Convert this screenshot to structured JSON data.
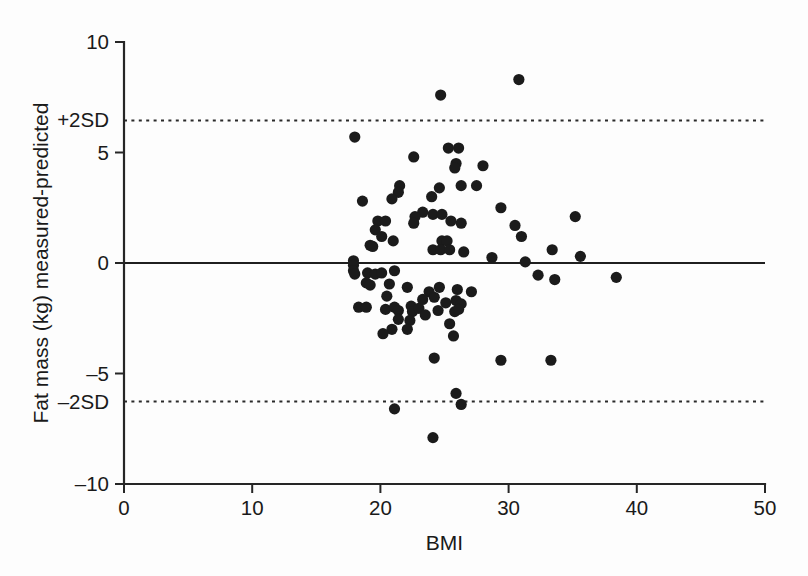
{
  "chart_data": {
    "type": "scatter",
    "title": "",
    "xlabel": "BMI",
    "ylabel": "Fat mass (kg) measured-predicted",
    "xlim": [
      0,
      50
    ],
    "ylim": [
      -10,
      10
    ],
    "xticks": [
      "0",
      "10",
      "20",
      "30",
      "40",
      "50"
    ],
    "xtick_values": [
      0,
      10,
      20,
      30,
      40,
      50
    ],
    "yticks": [
      "10",
      "5",
      "0",
      "-5",
      "-10"
    ],
    "ytick_values": [
      10,
      5,
      0,
      -5,
      -10
    ],
    "grid": false,
    "legend": "none",
    "reference_lines": [
      {
        "label": "+2SD",
        "value": 6.45,
        "style": "dotted"
      },
      {
        "label": "",
        "value": 0,
        "style": "solid"
      },
      {
        "label": "-2SD",
        "value": -6.27,
        "style": "dotted"
      }
    ],
    "marker": {
      "shape": "circle",
      "radius_px": 5.6,
      "color": "#1b1b1b"
    },
    "points": [
      [
        30.8,
        8.3
      ],
      [
        24.7,
        7.6
      ],
      [
        18.0,
        5.7
      ],
      [
        25.3,
        5.2
      ],
      [
        26.1,
        5.2
      ],
      [
        22.6,
        4.8
      ],
      [
        25.9,
        4.5
      ],
      [
        25.8,
        4.3
      ],
      [
        28.0,
        4.4
      ],
      [
        27.5,
        3.5
      ],
      [
        26.3,
        3.5
      ],
      [
        21.5,
        3.5
      ],
      [
        21.4,
        3.2
      ],
      [
        24.6,
        3.4
      ],
      [
        20.9,
        2.9
      ],
      [
        24.0,
        3.0
      ],
      [
        18.6,
        2.8
      ],
      [
        29.4,
        2.5
      ],
      [
        24.1,
        2.2
      ],
      [
        23.3,
        2.3
      ],
      [
        24.8,
        2.2
      ],
      [
        22.7,
        2.1
      ],
      [
        22.6,
        1.8
      ],
      [
        19.8,
        1.9
      ],
      [
        20.4,
        1.9
      ],
      [
        19.6,
        1.5
      ],
      [
        25.5,
        1.9
      ],
      [
        26.3,
        1.8
      ],
      [
        30.5,
        1.7
      ],
      [
        35.2,
        2.1
      ],
      [
        20.1,
        1.2
      ],
      [
        21.0,
        1.0
      ],
      [
        24.8,
        1.0
      ],
      [
        25.2,
        1.0
      ],
      [
        31.0,
        1.2
      ],
      [
        19.2,
        0.8
      ],
      [
        19.4,
        0.75
      ],
      [
        24.1,
        0.6
      ],
      [
        24.7,
        0.6
      ],
      [
        25.4,
        0.6
      ],
      [
        26.5,
        0.5
      ],
      [
        33.4,
        0.6
      ],
      [
        28.7,
        0.25
      ],
      [
        35.6,
        0.3
      ],
      [
        17.9,
        0.1
      ],
      [
        17.9,
        -0.1
      ],
      [
        17.9,
        -0.35
      ],
      [
        18.0,
        -0.5
      ],
      [
        31.3,
        0.05
      ],
      [
        19.0,
        -0.45
      ],
      [
        19.6,
        -0.5
      ],
      [
        20.1,
        -0.45
      ],
      [
        21.1,
        -0.35
      ],
      [
        32.3,
        -0.55
      ],
      [
        33.6,
        -0.75
      ],
      [
        38.4,
        -0.65
      ],
      [
        18.9,
        -0.9
      ],
      [
        19.2,
        -1.0
      ],
      [
        20.7,
        -0.95
      ],
      [
        22.1,
        -1.1
      ],
      [
        23.8,
        -1.3
      ],
      [
        24.6,
        -1.1
      ],
      [
        26.0,
        -1.2
      ],
      [
        27.1,
        -1.3
      ],
      [
        20.5,
        -1.5
      ],
      [
        23.3,
        -1.65
      ],
      [
        24.2,
        -1.55
      ],
      [
        25.1,
        -1.8
      ],
      [
        25.9,
        -1.7
      ],
      [
        26.3,
        -1.85
      ],
      [
        18.3,
        -2.0
      ],
      [
        18.9,
        -2.0
      ],
      [
        20.4,
        -2.1
      ],
      [
        21.1,
        -2.0
      ],
      [
        21.4,
        -2.15
      ],
      [
        22.4,
        -1.95
      ],
      [
        22.5,
        -2.2
      ],
      [
        23.0,
        -2.05
      ],
      [
        23.5,
        -2.35
      ],
      [
        24.5,
        -2.15
      ],
      [
        25.8,
        -2.2
      ],
      [
        26.1,
        -2.1
      ],
      [
        21.4,
        -2.55
      ],
      [
        22.3,
        -2.6
      ],
      [
        25.4,
        -2.75
      ],
      [
        20.9,
        -3.0
      ],
      [
        22.1,
        -3.0
      ],
      [
        20.2,
        -3.2
      ],
      [
        25.7,
        -3.3
      ],
      [
        24.2,
        -4.3
      ],
      [
        29.4,
        -4.4
      ],
      [
        33.3,
        -4.4
      ],
      [
        25.9,
        -5.9
      ],
      [
        26.3,
        -6.4
      ],
      [
        21.1,
        -6.6
      ],
      [
        24.1,
        -7.9
      ]
    ]
  },
  "axes": {
    "x_axis_name": "BMI",
    "y_axis_name": "Fat mass (kg) measured-predicted"
  }
}
